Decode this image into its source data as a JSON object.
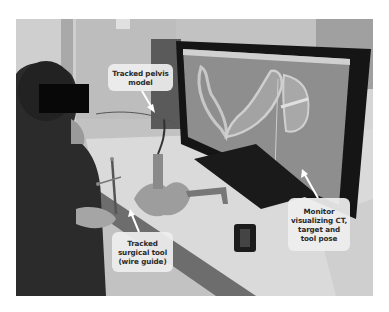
{
  "figure": {
    "type": "photograph",
    "colors": {
      "label_background": "#eeeeee",
      "label_text": "#2a2a2a",
      "arrow": "#ffffff",
      "privacy_box": "#080808"
    }
  },
  "labels": {
    "pelvis": {
      "lines": [
        "Tracked pelvis",
        "model"
      ]
    },
    "monitor": {
      "lines": [
        "Monitor",
        "visualizing CT,",
        "target and",
        "tool pose"
      ]
    },
    "tool": {
      "lines": [
        "Tracked",
        "surgical tool",
        "(wire guide)"
      ]
    }
  }
}
